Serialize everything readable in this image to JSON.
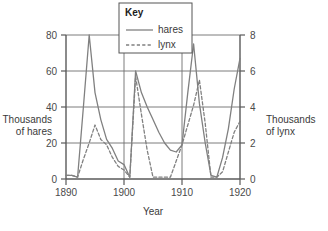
{
  "chart_data": {
    "type": "line",
    "title": "",
    "xlabel": "Year",
    "ylabel": "Thousands of hares",
    "y2label": "Thousands of lynx",
    "xlim": [
      1890,
      1920
    ],
    "ylim": [
      0,
      80
    ],
    "y2lim": [
      0,
      8
    ],
    "grid": true,
    "legend_position": "top-center",
    "legend_title": "Key",
    "xticks": [
      1890,
      1900,
      1910,
      1920
    ],
    "yticks": [
      0,
      20,
      40,
      60,
      80
    ],
    "y2ticks": [
      0,
      2,
      4,
      6,
      8
    ],
    "x": [
      1890,
      1891,
      1892,
      1893,
      1894,
      1895,
      1896,
      1897,
      1898,
      1899,
      1900,
      1901,
      1902,
      1903,
      1904,
      1905,
      1906,
      1907,
      1908,
      1909,
      1910,
      1911,
      1912,
      1913,
      1914,
      1915,
      1916,
      1917,
      1918,
      1919,
      1920
    ],
    "series": [
      {
        "name": "hares",
        "axis": "left",
        "units": "thousands of hares",
        "style": "solid",
        "color": "#808080",
        "values": [
          2,
          2,
          1,
          40,
          80,
          48,
          33,
          22,
          17,
          10,
          8,
          1,
          60,
          48,
          40,
          33,
          26,
          20,
          16,
          15,
          19,
          48,
          75,
          42,
          20,
          2,
          1,
          12,
          28,
          50,
          67
        ]
      },
      {
        "name": "lynx",
        "axis": "right",
        "units": "thousands of lynx",
        "style": "dashed",
        "color": "#808080",
        "values": [
          0.2,
          0.2,
          0.1,
          1.1,
          2.0,
          3.0,
          2.2,
          1.9,
          1.2,
          0.7,
          0.5,
          0.1,
          5.7,
          3.6,
          1.6,
          0.1,
          0.1,
          0.1,
          0.1,
          1.0,
          1.9,
          3.0,
          4.1,
          5.5,
          3.1,
          0.1,
          0.1,
          0.4,
          1.5,
          2.6,
          3.2
        ]
      }
    ],
    "peaks": {
      "hares_max": {
        "year": 1894,
        "value": 80
      },
      "lynx_max": {
        "year": 1902,
        "value": 5.7
      }
    }
  },
  "labels": {
    "left_axis_line1": "Thousands",
    "left_axis_line2": "of hares",
    "right_axis_line1": "Thousands",
    "right_axis_line2": "of lynx",
    "x_axis": "Year"
  },
  "legend": {
    "title": "Key",
    "items": [
      {
        "label": "hares",
        "style": "solid"
      },
      {
        "label": "lynx",
        "style": "dashed"
      }
    ]
  },
  "colors": {
    "line": "#808080",
    "axis": "#5a5a5a",
    "grid": "#6e6e6e",
    "text": "#3a3a3a",
    "background": "#ffffff"
  }
}
